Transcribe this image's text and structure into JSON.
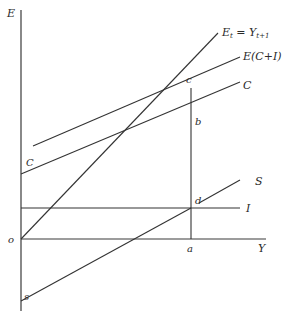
{
  "diagram": {
    "axes": {
      "y_label": "E",
      "x_label": "Y",
      "origin_label": "o"
    },
    "curves": {
      "equilibrium_line": {
        "label_main": "E",
        "label_sub_t": "t",
        "label_eq": " = Y",
        "label_sub_t1": "t+1"
      },
      "total_expenditure": {
        "label": "E(C+I)"
      },
      "consumption": {
        "label_right": "C",
        "label_left": "C"
      },
      "saving": {
        "label": "S",
        "intercept_label": "s"
      },
      "investment": {
        "label": "I"
      }
    },
    "points": {
      "c": "c",
      "b": "b",
      "d": "d",
      "a": "a"
    },
    "colors": {
      "line": "#333333",
      "background": "#ffffff"
    }
  }
}
